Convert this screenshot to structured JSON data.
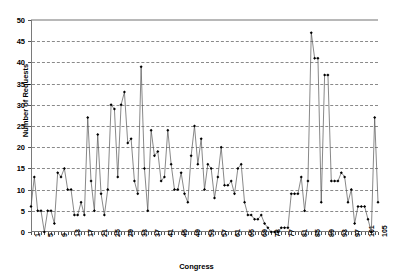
{
  "chart_data": {
    "type": "line",
    "title": "",
    "xlabel": "Congress",
    "ylabel": "Number of Requests",
    "ylim": [
      0,
      50
    ],
    "ytick_step": 5,
    "yticks": [
      0,
      5,
      10,
      15,
      20,
      25,
      30,
      35,
      40,
      45,
      50
    ],
    "xlim": [
      1,
      105
    ],
    "xtick_step": 4,
    "xticks": [
      1,
      5,
      9,
      13,
      17,
      21,
      25,
      29,
      33,
      37,
      41,
      45,
      49,
      53,
      57,
      61,
      65,
      69,
      73,
      77,
      81,
      85,
      89,
      93,
      97,
      101,
      105
    ],
    "grid": "horizontal-dashed",
    "legend": "none",
    "marker": "filled-diamond",
    "line_color": "#555555",
    "marker_color": "#000000",
    "grid_color": "#8a8a8a",
    "axis_color": "#7a7a7a",
    "x": [
      1,
      2,
      3,
      4,
      5,
      6,
      7,
      8,
      9,
      10,
      11,
      12,
      13,
      14,
      15,
      16,
      17,
      18,
      19,
      20,
      21,
      22,
      23,
      24,
      25,
      26,
      27,
      28,
      29,
      30,
      31,
      32,
      33,
      34,
      35,
      36,
      37,
      38,
      39,
      40,
      41,
      42,
      43,
      44,
      45,
      46,
      47,
      48,
      49,
      50,
      51,
      52,
      53,
      54,
      55,
      56,
      57,
      58,
      59,
      60,
      61,
      62,
      63,
      64,
      65,
      66,
      67,
      68,
      69,
      70,
      71,
      72,
      73,
      74,
      75,
      76,
      77,
      78,
      79,
      80,
      81,
      82,
      83,
      84,
      85,
      86,
      87,
      88,
      89,
      90,
      91,
      92,
      93,
      94,
      95,
      96,
      97,
      98,
      99,
      100,
      101,
      102,
      103,
      104,
      105
    ],
    "values": [
      6,
      13,
      5,
      5,
      0,
      5,
      5,
      2,
      14,
      13,
      15,
      10,
      10,
      4,
      4,
      7,
      4,
      27,
      12,
      5,
      23,
      9,
      4,
      10,
      30,
      29,
      13,
      30,
      33,
      21,
      22,
      12,
      9,
      39,
      15,
      5,
      24,
      18,
      19,
      12,
      13,
      24,
      16,
      10,
      10,
      14,
      9,
      7,
      18,
      25,
      16,
      22,
      10,
      16,
      15,
      8,
      13,
      20,
      11,
      11,
      12,
      9,
      15,
      16,
      7,
      4,
      4,
      3,
      3,
      4,
      2,
      1,
      0,
      0,
      0,
      1,
      1,
      1,
      9,
      9,
      9,
      13,
      5,
      12,
      47,
      41,
      41,
      7,
      37,
      37,
      12,
      12,
      12,
      14,
      13,
      7,
      10,
      2,
      6,
      6,
      6,
      3,
      0,
      27,
      7
    ],
    "categories_note": "Congress number"
  }
}
